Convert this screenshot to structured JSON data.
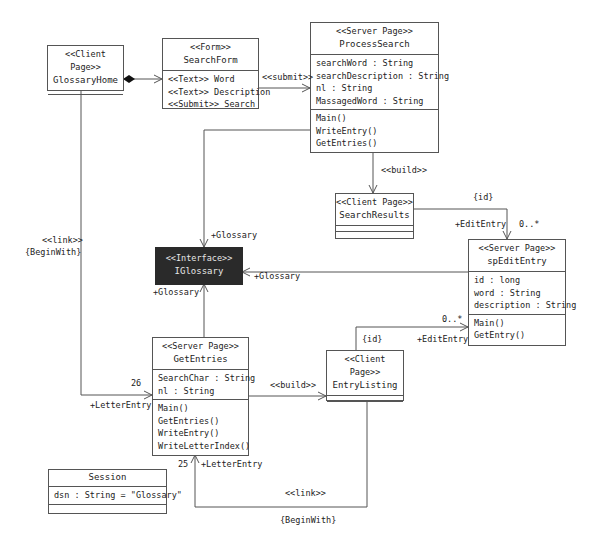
{
  "diagram": {
    "classes": {
      "glossary_home": {
        "stereotype": "<<Client Page>>",
        "name": "GlossaryHome"
      },
      "search_form": {
        "stereotype": "<<Form>>",
        "name": "SearchForm",
        "attributes": [
          "<<Text>> Word",
          "<<Text>> Description",
          "<<Submit>> Search"
        ]
      },
      "process_search": {
        "stereotype": "<<Server Page>>",
        "name": "ProcessSearch",
        "attributes": [
          "searchWord : String",
          "searchDescription : String",
          "nl : String",
          "MassagedWord : String"
        ],
        "operations": [
          "Main()",
          "WriteEntry()",
          "GetEntries()"
        ]
      },
      "search_results": {
        "stereotype": "<<Client Page>>",
        "name": "SearchResults"
      },
      "sp_edit_entry": {
        "stereotype": "<<Server Page>>",
        "name": "spEditEntry",
        "attributes": [
          "id : long",
          "word : String",
          "description : String"
        ],
        "operations": [
          "Main()",
          "GetEntry()"
        ]
      },
      "iglossary": {
        "stereotype": "<<Interface>>",
        "name": "IGlossary"
      },
      "get_entries": {
        "stereotype": "<<Server Page>>",
        "name": "GetEntries",
        "attributes": [
          "SearchChar : String",
          "nl : String"
        ],
        "operations": [
          "Main()",
          "GetEntries()",
          "WriteEntry()",
          "WriteLetterIndex()"
        ]
      },
      "entry_listing": {
        "stereotype": "<<Client Page>>",
        "name": "EntryListing"
      },
      "session": {
        "name": "Session",
        "attributes": [
          "dsn : String = \"Glossary\""
        ]
      }
    },
    "labels": {
      "submit": "<<submit>>",
      "build_1": "<<build>>",
      "id_1": "{id}",
      "edit_entry_1": "+EditEntry",
      "mult_1": "0..*",
      "glossary_top": "+Glossary",
      "glossary_right": "+Glossary",
      "glossary_bottom": "+Glossary",
      "link_1": "<<link>>",
      "begin_with_1": "{BeginWith}",
      "mult_26": "26",
      "letter_entry_1": "+LetterEntry",
      "build_2": "<<build>>",
      "id_2": "{id}",
      "edit_entry_2": "+EditEntry",
      "mult_2": "0..*",
      "mult_25": "25",
      "letter_entry_2": "+LetterEntry",
      "link_2": "<<link>>",
      "begin_with_2": "{BeginWith}"
    }
  }
}
